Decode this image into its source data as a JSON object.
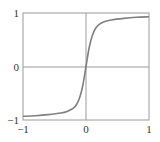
{
  "chart_data": {
    "type": "line",
    "title": "",
    "xlabel": "",
    "ylabel": "",
    "xlim": [
      -1,
      1
    ],
    "ylim": [
      -1,
      1
    ],
    "grid": false,
    "axes_lines_at_zero": true,
    "legend": null,
    "x_ticks": [
      "−1",
      "0",
      "1"
    ],
    "y_ticks": [
      "−1",
      "0",
      "1"
    ],
    "series": [
      {
        "name": "sigmoid curve",
        "color": "#808080",
        "x": [
          -1.0,
          -0.8,
          -0.6,
          -0.4,
          -0.3,
          -0.2,
          -0.15,
          -0.1,
          -0.05,
          0.0,
          0.05,
          0.1,
          0.15,
          0.2,
          0.3,
          0.4,
          0.6,
          0.8,
          1.0
        ],
        "y": [
          -0.93,
          -0.92,
          -0.9,
          -0.87,
          -0.84,
          -0.78,
          -0.71,
          -0.58,
          -0.35,
          0.0,
          0.35,
          0.58,
          0.71,
          0.78,
          0.84,
          0.87,
          0.9,
          0.92,
          0.93
        ]
      }
    ]
  },
  "colors": {
    "frame": "#9a9a9a",
    "axis_zero": "#9a9a9a",
    "curve": "#808080",
    "text": "#333333"
  }
}
